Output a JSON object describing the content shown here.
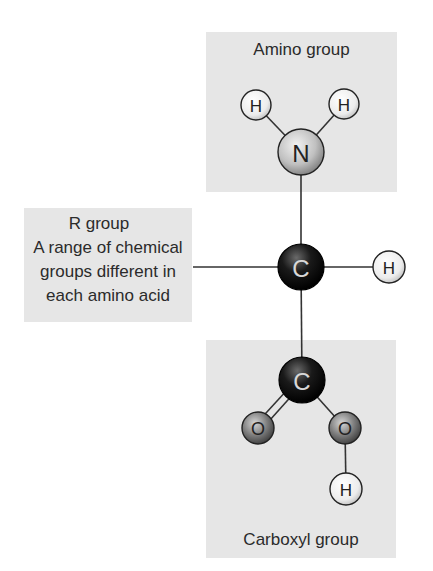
{
  "diagram": {
    "groups": {
      "amino": {
        "label": "Amino group"
      },
      "r_group": {
        "label": "R group",
        "description_lines": [
          "A range of chemical",
          "groups different in",
          "each amino acid"
        ]
      },
      "carboxyl": {
        "label": "Carboxyl group"
      }
    },
    "atoms": [
      {
        "id": "H_amino_left",
        "symbol": "H"
      },
      {
        "id": "H_amino_right",
        "symbol": "H"
      },
      {
        "id": "N",
        "symbol": "N"
      },
      {
        "id": "C_alpha",
        "symbol": "C"
      },
      {
        "id": "H_alpha",
        "symbol": "H"
      },
      {
        "id": "C_carboxyl",
        "symbol": "C"
      },
      {
        "id": "O_double",
        "symbol": "O"
      },
      {
        "id": "O_hydroxyl",
        "symbol": "O"
      },
      {
        "id": "H_hydroxyl",
        "symbol": "H"
      }
    ],
    "colors": {
      "box_fill": "#e6e6e6",
      "hydrogen": "#f0f0f0",
      "nitrogen": "#c8c8c8",
      "carbon": "#111111",
      "oxygen": "#7a7a7a",
      "bond": "#333333"
    }
  }
}
